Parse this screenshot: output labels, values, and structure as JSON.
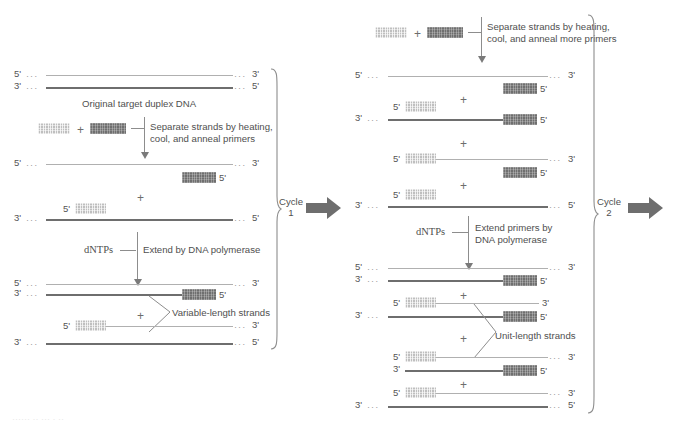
{
  "figure": {
    "colors": {
      "primer_light": "#bfbfbf",
      "primer_dark": "#6f6f6f",
      "strand_dark": "#6e6e6e",
      "strand_light": "#b0b0b0",
      "arrow_fill": "#6e6e6e",
      "text": "#4f4f4f"
    }
  },
  "labels": {
    "five_prime": "5'",
    "three_prime": "3'",
    "plus": "+",
    "dots": "···"
  },
  "panel1": {
    "name": "Cycle 1",
    "duplex_caption": "Original target duplex DNA",
    "step1_text_line1": "Separate strands by heating,",
    "step1_text_line2": "cool, and anneal primers",
    "step2_reagent": "dNTPs",
    "step2_text": "Extend by DNA polymerase",
    "product_note": "Variable-length strands",
    "cycle_word": "Cycle",
    "cycle_number": "1"
  },
  "panel2": {
    "name": "Cycle 2",
    "step1_text_line1": "Separate strands by heating,",
    "step1_text_line2": "cool, and anneal more primers",
    "step2_reagent": "dNTPs",
    "step2_text_line1": "Extend primers by",
    "step2_text_line2": "DNA polymerase",
    "product_note": "Unit-length strands",
    "cycle_word": "Cycle",
    "cycle_number": "2"
  },
  "footer": {
    "cut_caption": "······ ·· ··· · ··"
  }
}
